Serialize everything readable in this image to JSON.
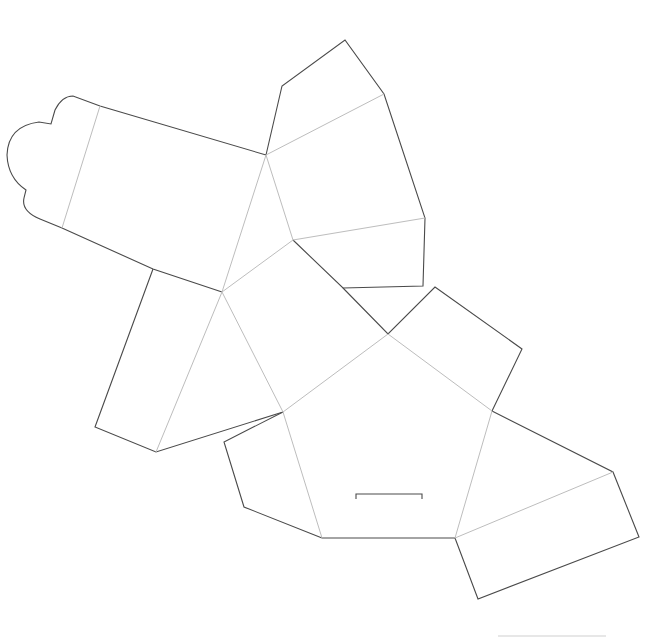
{
  "diagram": {
    "type": "packaging-dieline",
    "colors": {
      "background": "#ffffff",
      "cut_line": "#4a4a4a",
      "fold_line": "#bdbdbd",
      "reference_line": "#cfcfcf"
    },
    "cut_paths": [
      {
        "name": "tuck-flap-outline",
        "d": "M 62 228 L 40 219 Q 21 211 24 198 L 26 190 Q 8 178 7 155 Q 8 126 39 122 L 51 124 L 55 110 Q 62 96 73 96 L 100 106 L 266 155"
      },
      {
        "name": "tuck-flap-bottom-edge",
        "d": "M 62 228 L 153 269 L 222 292"
      },
      {
        "name": "top-flap-outline",
        "d": "M 266 155 L 282 86 L 345 40 L 384 94 L 425 218 L 423 286 L 343 288 L 293 240"
      },
      {
        "name": "left-side-panel-outline",
        "d": "M 153 269 L 95 427 L 156 452 L 283 412"
      },
      {
        "name": "upper-right-panel-outline",
        "d": "M 343 288 L 388 334 L 435 287 L 522 349 L 492 411"
      },
      {
        "name": "lower-left-flap-outline",
        "d": "M 283 412 L 224 442 L 244 507 L 322 538"
      },
      {
        "name": "bottom-edge",
        "d": "M 322 538 L 455 538"
      },
      {
        "name": "right-panel-outline",
        "d": "M 492 411 L 613 472 L 639 537 L 478 599 L 455 538"
      }
    ],
    "fold_paths": [
      {
        "name": "tuck-flap-fold",
        "d": "M 100 106 L 62 228"
      },
      {
        "name": "fold-a-c",
        "d": "M 266 155 L 222 292"
      },
      {
        "name": "fold-a-b",
        "d": "M 266 155 L 293 240"
      },
      {
        "name": "fold-top-flap-upper",
        "d": "M 266 155 L 384 94"
      },
      {
        "name": "fold-top-flap-lower",
        "d": "M 293 240 L 425 218"
      },
      {
        "name": "fold-b-c",
        "d": "M 293 240 L 222 292"
      },
      {
        "name": "fold-c-left-panel",
        "d": "M 222 292 L 156 452"
      },
      {
        "name": "fold-c-e",
        "d": "M 222 292 L 283 412"
      },
      {
        "name": "fold-e-d",
        "d": "M 283 412 L 388 334"
      },
      {
        "name": "fold-d-f",
        "d": "M 388 334 L 492 411"
      },
      {
        "name": "fold-e-g",
        "d": "M 283 412 L 322 538"
      },
      {
        "name": "fold-f-h",
        "d": "M 492 411 L 455 538"
      },
      {
        "name": "fold-right-panel",
        "d": "M 455 538 L 613 472"
      }
    ],
    "slot": {
      "name": "tuck-slot",
      "d": "M 356 499 L 356 494 L 422 494 L 422 499"
    },
    "reference_line": {
      "name": "scale-reference-line",
      "d": "M 498 636 L 606 636"
    }
  }
}
